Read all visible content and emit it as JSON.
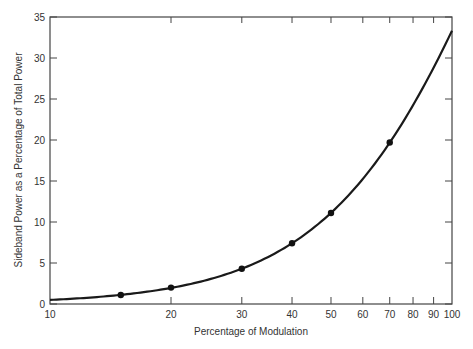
{
  "chart_data": {
    "type": "line",
    "title": "",
    "xlabel": "Percentage of Modulation",
    "ylabel": "Sideband Power as a Percentage of Total Power",
    "xscale": "log",
    "xlim": [
      10,
      100
    ],
    "ylim": [
      0,
      35
    ],
    "x_ticks": [
      10,
      20,
      30,
      40,
      50,
      60,
      70,
      80,
      90,
      100
    ],
    "y_ticks": [
      0,
      5,
      10,
      15,
      20,
      25,
      30,
      35
    ],
    "grid": false,
    "legend": null,
    "series": [
      {
        "name": "Sideband power",
        "curve": "m^2/(2+m^2)*100",
        "x": [
          10,
          15,
          20,
          30,
          40,
          50,
          60,
          70,
          80,
          90,
          100
        ],
        "values": [
          0.5,
          1.1,
          2.0,
          4.3,
          7.4,
          11.1,
          15.3,
          19.7,
          24.2,
          28.8,
          33.3
        ]
      }
    ],
    "markers": {
      "x": [
        15,
        20,
        30,
        40,
        50,
        70
      ],
      "values": [
        1.1,
        2.0,
        4.3,
        7.4,
        11.1,
        19.7
      ]
    }
  }
}
